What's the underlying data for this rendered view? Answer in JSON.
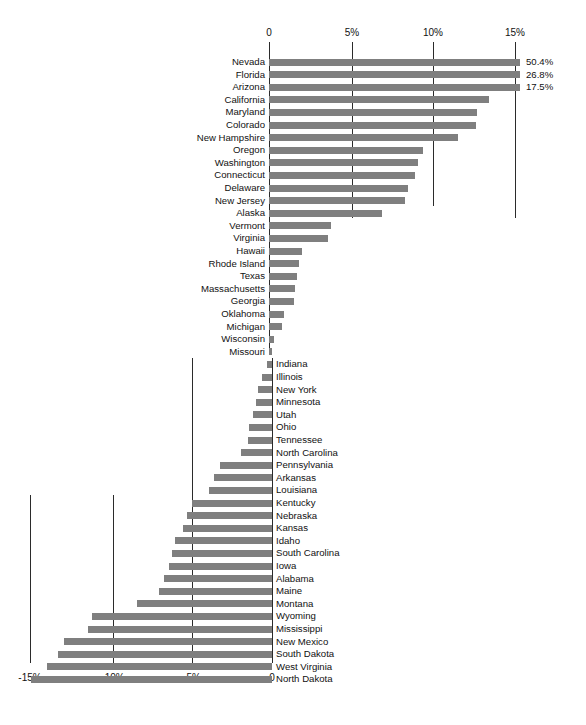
{
  "chart_data": {
    "type": "bar",
    "orientation": "horizontal",
    "title": "",
    "subtitle": "",
    "xlabel": "",
    "ylabel": "",
    "grid": true,
    "legend": null,
    "top_axis": {
      "tick_labels": [
        "0",
        "5%",
        "10%",
        "15%"
      ],
      "tick_values": [
        0,
        5,
        10,
        15
      ],
      "position": "top"
    },
    "bottom_axis": {
      "tick_labels": [
        "-15%",
        "-10%",
        "-5%",
        "0"
      ],
      "tick_values": [
        -15,
        -10,
        -5,
        0
      ],
      "position": "bottom"
    },
    "xlim": [
      -15.5,
      15.5
    ],
    "note": "Top three bars are clipped at the plot edge and carry explicit value labels.",
    "bar_color": "#7f7f7f",
    "categories": [
      "Nevada",
      "Florida",
      "Arizona",
      "California",
      "Maryland",
      "Colorado",
      "New Hampshire",
      "Oregon",
      "Washington",
      "Connecticut",
      "Delaware",
      "New Jersey",
      "Alaska",
      "Vermont",
      "Virginia",
      "Hawaii",
      "Rhode Island",
      "Texas",
      "Massachusetts",
      "Georgia",
      "Oklahoma",
      "Michigan",
      "Wisconsin",
      "Missouri",
      "Indiana",
      "Illinois",
      "New York",
      "Minnesota",
      "Utah",
      "Ohio",
      "Tennessee",
      "North Carolina",
      "Pennsylvania",
      "Arkansas",
      "Louisiana",
      "Kentucky",
      "Nebraska",
      "Kansas",
      "Idaho",
      "South Carolina",
      "Iowa",
      "Alabama",
      "Maine",
      "Montana",
      "Wyoming",
      "Mississippi",
      "New Mexico",
      "South Dakota",
      "West Virginia",
      "North Dakota"
    ],
    "values": [
      50.4,
      26.8,
      17.5,
      13.4,
      12.7,
      12.6,
      11.5,
      9.4,
      9.1,
      8.9,
      8.5,
      8.3,
      6.9,
      3.8,
      3.6,
      2.0,
      1.8,
      1.7,
      1.6,
      1.5,
      0.9,
      0.8,
      0.3,
      0.2,
      -0.3,
      -0.6,
      -0.9,
      -1.0,
      -1.2,
      -1.4,
      -1.5,
      -1.9,
      -3.2,
      -3.6,
      -3.9,
      -5.0,
      -5.3,
      -5.5,
      -6.0,
      -6.2,
      -6.4,
      -6.7,
      -7.0,
      -8.4,
      -11.2,
      -11.4,
      -12.9,
      -13.3,
      -14.0,
      -15.0
    ],
    "point_labels": [
      {
        "category": "Nevada",
        "text": "50.4%"
      },
      {
        "category": "Florida",
        "text": "26.8%"
      },
      {
        "category": "Arizona",
        "text": "17.5%"
      }
    ]
  }
}
